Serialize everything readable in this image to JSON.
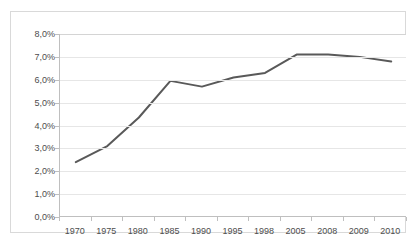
{
  "chart_data": {
    "type": "line",
    "title": "",
    "subtitle": "",
    "xlabel": "",
    "ylabel": "",
    "categories": [
      "1970",
      "1975",
      "1980",
      "1985",
      "1990",
      "1995",
      "1998",
      "2005",
      "2008",
      "2009",
      "2010"
    ],
    "series": [
      {
        "name": "",
        "values": [
          2.4,
          3.1,
          4.35,
          5.95,
          5.7,
          6.1,
          6.3,
          7.1,
          7.1,
          7.0,
          6.8
        ]
      }
    ],
    "y_tick_labels": [
      "8,0%",
      "7,0%",
      "6,0%",
      "5,0%",
      "4,0%",
      "3,0%",
      "2,0%",
      "1,0%",
      "0,0%"
    ],
    "y_tick_values": [
      8.0,
      7.0,
      6.0,
      5.0,
      4.0,
      3.0,
      2.0,
      1.0,
      0.0
    ],
    "ylim": [
      0.0,
      8.0
    ],
    "value_suffix": "%",
    "decimal_separator": ",",
    "grid": true,
    "grid_axis": "y",
    "legend": false,
    "legend_position": "none",
    "colors": {
      "line": "#595959",
      "gridline": "#e6e6e6",
      "axis": "#bfbfbf",
      "frame": "#d9d9d9",
      "text": "#4d4d4d",
      "background": "#ffffff"
    },
    "line_width": 2
  }
}
